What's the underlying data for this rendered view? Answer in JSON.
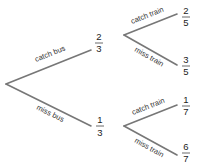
{
  "diagram": {
    "type": "probability-tree",
    "level1": [
      {
        "label": "catch bus",
        "probability": {
          "numerator": "2",
          "denominator": "3"
        }
      },
      {
        "label": "miss bus",
        "probability": {
          "numerator": "1",
          "denominator": "3"
        }
      }
    ],
    "level2": {
      "after_catch_bus": [
        {
          "label": "catch train",
          "probability": {
            "numerator": "2",
            "denominator": "5"
          }
        },
        {
          "label": "miss train",
          "probability": {
            "numerator": "3",
            "denominator": "5"
          }
        }
      ],
      "after_miss_bus": [
        {
          "label": "catch train",
          "probability": {
            "numerator": "1",
            "denominator": "7"
          }
        },
        {
          "label": "miss train",
          "probability": {
            "numerator": "6",
            "denominator": "7"
          }
        }
      ]
    },
    "colors": {
      "line": "#777777",
      "text": "#222222"
    }
  }
}
